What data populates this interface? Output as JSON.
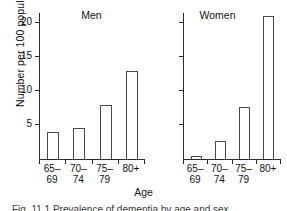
{
  "figure": {
    "xlabel": "Age",
    "ylabel": "Number per 100 population",
    "caption": "Fig. 11.1  Prevalence of dementia by age and sex"
  },
  "chart_data": {
    "type": "bar",
    "title": "",
    "xlabel": "Age",
    "ylabel": "Number per 100 population",
    "categories": [
      "65-69",
      "70-74",
      "75-79",
      "80+"
    ],
    "category_lines": [
      {
        "line1": "65–",
        "line2": "69"
      },
      {
        "line1": "70–",
        "line2": "74"
      },
      {
        "line1": "75–",
        "line2": "79"
      },
      {
        "line1": "80+",
        "line2": ""
      }
    ],
    "panels": [
      {
        "name": "men",
        "title": "Men",
        "values": [
          4.0,
          4.5,
          8.0,
          13.0
        ],
        "y_ticks": [
          5,
          10,
          15,
          20
        ],
        "y_tick_labels": [
          "5",
          "10",
          "15",
          "20"
        ],
        "ylim": [
          0,
          21.5
        ],
        "show_y_tick_labels": true
      },
      {
        "name": "women",
        "title": "Women",
        "values": [
          0.5,
          2.7,
          7.7,
          21.0
        ],
        "y_ticks": [
          5,
          10,
          15,
          20
        ],
        "y_tick_labels": [
          "",
          "",
          "",
          ""
        ],
        "ylim": [
          0,
          21.5
        ],
        "show_y_tick_labels": false
      }
    ],
    "grid": false,
    "legend": "none",
    "bar_fill": "#ffffff",
    "bar_edge": "#4a4a4a",
    "axis_color": "#2b2b2b"
  }
}
